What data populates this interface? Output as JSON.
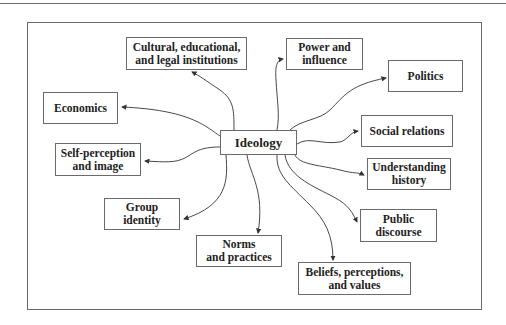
{
  "diagram": {
    "center": {
      "label": "Ideology",
      "x": 220,
      "y": 130,
      "w": 77,
      "h": 25
    },
    "nodes": [
      {
        "id": "cultural",
        "label": "Cultural, educational,\nand legal institutions",
        "x": 126,
        "y": 37,
        "w": 121,
        "h": 33
      },
      {
        "id": "power",
        "label": "Power and\ninfluence",
        "x": 286,
        "y": 38,
        "w": 77,
        "h": 32
      },
      {
        "id": "politics",
        "label": "Politics",
        "x": 388,
        "y": 60,
        "w": 75,
        "h": 32
      },
      {
        "id": "economics",
        "label": "Economics",
        "x": 43,
        "y": 92,
        "w": 75,
        "h": 32
      },
      {
        "id": "social",
        "label": "Social relations",
        "x": 361,
        "y": 115,
        "w": 92,
        "h": 32
      },
      {
        "id": "self",
        "label": "Self-perception\nand image",
        "x": 55,
        "y": 143,
        "w": 86,
        "h": 33
      },
      {
        "id": "history",
        "label": "Understanding\nhistory",
        "x": 367,
        "y": 158,
        "w": 84,
        "h": 32
      },
      {
        "id": "group",
        "label": "Group\nidentity",
        "x": 104,
        "y": 198,
        "w": 76,
        "h": 32
      },
      {
        "id": "public",
        "label": "Public\ndiscourse",
        "x": 360,
        "y": 209,
        "w": 77,
        "h": 33
      },
      {
        "id": "norms",
        "label": "Norms\nand practices",
        "x": 196,
        "y": 235,
        "w": 86,
        "h": 32
      },
      {
        "id": "beliefs",
        "label": "Beliefs, perceptions,\nand values",
        "x": 298,
        "y": 262,
        "w": 113,
        "h": 33
      }
    ],
    "edges": [
      {
        "to": "cultural",
        "path": "M234,130 C234,110 234,100 220,90 C205,80 200,76 192,72"
      },
      {
        "to": "power",
        "path": "M277,130 C280,115 277,100 276,80 C275,65 277,60 283,59"
      },
      {
        "to": "politics",
        "path": "M290,130 C300,120 320,120 330,110 C345,95 350,85 386,78"
      },
      {
        "to": "economics",
        "path": "M220,136 C205,126 190,110 122,107"
      },
      {
        "to": "social",
        "path": "M297,144 C310,136 320,145 340,142 C348,140 350,132 358,131"
      },
      {
        "to": "self",
        "path": "M220,147 C200,147 195,152 185,158 C175,163 165,162 145,161"
      },
      {
        "to": "history",
        "path": "M295,155 C300,165 320,165 340,170 C355,174 358,172 364,175"
      },
      {
        "to": "group",
        "path": "M226,155 C228,180 228,205 184,219"
      },
      {
        "to": "public",
        "path": "M285,155 C288,175 310,185 330,195 C345,203 350,207 357,222"
      },
      {
        "to": "norms",
        "path": "M247,155 C250,175 265,190 258,233"
      },
      {
        "to": "beliefs",
        "path": "M277,155 C276,175 290,185 310,205 C325,220 333,235 333,260"
      }
    ],
    "colors": {
      "line": "#333333",
      "border": "#6a6a6a",
      "text": "#222222"
    }
  }
}
